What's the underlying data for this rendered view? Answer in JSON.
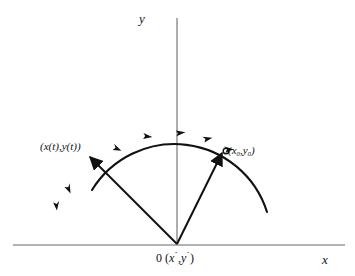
{
  "figure": {
    "name": "trajectory-arc-diagram",
    "background_color": "#ffffff",
    "axis_color": "#999999",
    "curve_color": "#111111",
    "axes": {
      "x_label": "x",
      "y_label": "y",
      "origin_label_number": "0",
      "origin_label_coords_open": "(",
      "origin_label_x": "x",
      "origin_label_x_prime": "˙",
      "origin_label_comma": ",",
      "origin_label_y": "y",
      "origin_label_y_prime": "˙",
      "origin_label_coords_close": ")",
      "origin_label_full": "0 (x˙,y˙)",
      "x_axis_y_px": 245,
      "x_axis_x_start_px": 13,
      "x_axis_x_end_px": 345,
      "y_axis_x_px": 177,
      "y_axis_y_start_px": 18,
      "y_axis_y_end_px": 245
    },
    "points": [
      {
        "name": "point-x-t",
        "label_prefix": "(",
        "label": "(x(t),y(t))",
        "x_px": 88,
        "y_px": 155
      },
      {
        "name": "point-x-zero",
        "label": "(x",
        "label_sub_1": "0",
        "label_mid": ",y",
        "label_sub_2": "0",
        "label_end": ")",
        "label_full": "(x0,y0)",
        "x_px": 225,
        "y_px": 152
      }
    ],
    "arc": {
      "name": "trajectory-arc",
      "direction": "counterclockwise",
      "arrow_count": 6,
      "center_x_px": 177,
      "center_y_px": 248,
      "radius_px": 97,
      "start_angle_deg": 22,
      "end_angle_deg": 151
    },
    "vectors": [
      {
        "name": "vector-to-x-zero",
        "from_x_px": 177,
        "from_y_px": 244,
        "to_x_px": 222,
        "to_y_px": 152
      },
      {
        "name": "vector-to-x-t",
        "from_x_px": 177,
        "from_y_px": 244,
        "to_x_px": 89,
        "to_y_px": 156
      }
    ]
  }
}
